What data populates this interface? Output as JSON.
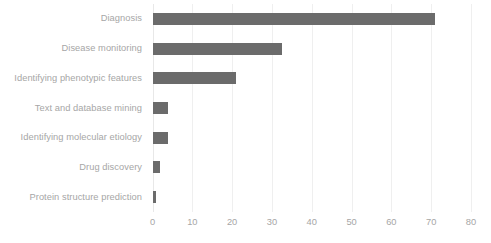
{
  "chart_data": {
    "type": "bar",
    "orientation": "horizontal",
    "title": "",
    "xlabel": "",
    "ylabel": "",
    "categories": [
      "Diagnosis",
      "Disease monitoring",
      "Identifying phenotypic features",
      "Text and database mining",
      "Identifying molecular etiology",
      "Drug discovery",
      "Protein structure prediction"
    ],
    "values": [
      71,
      32.5,
      21,
      4,
      4,
      2,
      1
    ],
    "xlim": [
      0,
      80
    ],
    "xticks": [
      0,
      10,
      20,
      30,
      40,
      50,
      60,
      70,
      80
    ],
    "xtick_labels": [
      "0",
      "10",
      "20",
      "30",
      "40",
      "50",
      "60",
      "70",
      "80"
    ],
    "grid": "vertical-only",
    "legend": "none",
    "bar_color": "#6b6b6b",
    "gridline_color": "#efefef",
    "label_color": "#a6a6a6",
    "background_color": "#ffffff"
  }
}
